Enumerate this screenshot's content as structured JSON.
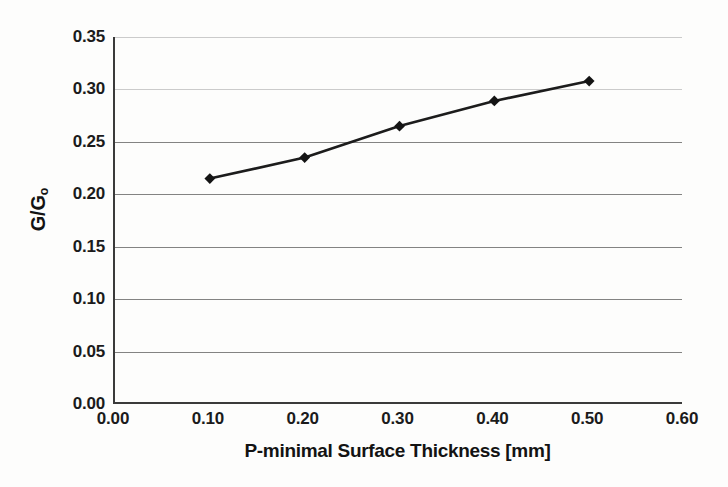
{
  "chart_data": {
    "type": "line",
    "title": "",
    "xlabel": "P-minimal Surface Thickness [mm]",
    "ylabel": "G/G₀",
    "ylabel_main": "G/G",
    "ylabel_sub": "o",
    "xlim": [
      0.0,
      0.6
    ],
    "ylim": [
      0.0,
      0.35
    ],
    "grid": "horizontal",
    "legend": "none",
    "x": [
      0.1,
      0.2,
      0.3,
      0.4,
      0.5
    ],
    "values": [
      0.215,
      0.235,
      0.265,
      0.289,
      0.308
    ],
    "series": [
      {
        "name": "G/Go vs thickness",
        "marker": "diamond",
        "color": "#1c1c1c",
        "values": [
          0.215,
          0.235,
          0.265,
          0.289,
          0.308
        ]
      }
    ],
    "xticks": [
      "0.00",
      "0.10",
      "0.20",
      "0.30",
      "0.40",
      "0.50",
      "0.60"
    ],
    "xtick_values": [
      0.0,
      0.1,
      0.2,
      0.3,
      0.4,
      0.5,
      0.6
    ],
    "yticks": [
      "0.00",
      "0.05",
      "0.10",
      "0.15",
      "0.20",
      "0.25",
      "0.30",
      "0.35"
    ],
    "ytick_values": [
      0.0,
      0.05,
      0.1,
      0.15,
      0.2,
      0.25,
      0.3,
      0.35
    ],
    "colors": {
      "line": "#1c1c1c",
      "marker": "#141414",
      "axis": "#3a3a3a",
      "grid": "#5a5a5a",
      "background": "#fdfdfc",
      "text": "#1b1b1b"
    }
  }
}
